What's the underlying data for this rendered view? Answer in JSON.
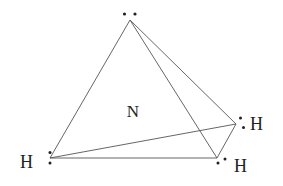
{
  "diagram": {
    "central_atom": {
      "label": "N",
      "x": 133,
      "y": 117
    },
    "vertices": {
      "apex": {
        "x": 130,
        "y": 20,
        "lone_pair": true
      },
      "bottom_left": {
        "x": 50,
        "y": 158,
        "label": "H"
      },
      "bottom_right": {
        "x": 217,
        "y": 158,
        "label": "H"
      },
      "right": {
        "x": 236,
        "y": 124,
        "label": "H"
      }
    },
    "labels": {
      "n": "N",
      "h_left": "H",
      "h_right": "H",
      "h_bottom_right": "H"
    },
    "colors": {
      "line": "#555555",
      "text": "#222222",
      "dot": "#222222",
      "background": "#ffffff"
    }
  }
}
